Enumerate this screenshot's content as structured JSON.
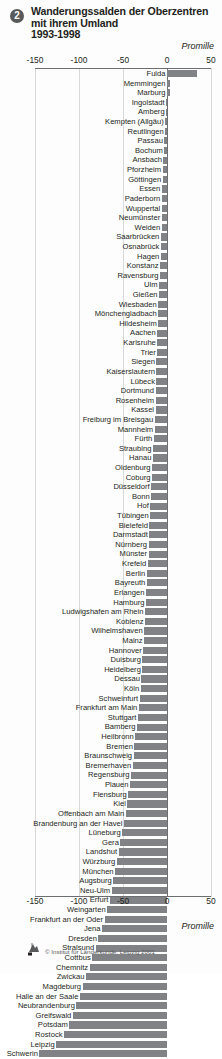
{
  "header": {
    "badge": "2",
    "unit": "Promille"
  },
  "footer": {
    "unit": "Promille",
    "credit": "© Institut für Länderkunde, Leipzig 2001"
  },
  "chart_data": {
    "type": "bar",
    "orientation": "horizontal",
    "xlabel": "Promille",
    "ylabel": "",
    "xlim": [
      -150,
      50
    ],
    "xticks": [
      -150,
      -100,
      -50,
      0,
      50
    ],
    "xticklabels": [
      "-150",
      "-100",
      "-50",
      "0",
      "50"
    ],
    "grid": true,
    "legend": false,
    "categories": [
      "Fulda",
      "Memmingen",
      "Marburg",
      "Ingolstadt",
      "Amberg",
      "Kempten (Allgäu)",
      "Reutlingen",
      "Passau",
      "Bochum",
      "Ansbach",
      "Pforzheim",
      "Göttingen",
      "Essen",
      "Paderborn",
      "Wuppertal",
      "Neumünster",
      "Weiden",
      "Saarbrücken",
      "Osnabrück",
      "Hagen",
      "Konstanz",
      "Ravensburg",
      "Ulm",
      "Gießen",
      "Wiesbaden",
      "Mönchengladbach",
      "Hildesheim",
      "Aachen",
      "Karlsruhe",
      "Trier",
      "Siegen",
      "Kaiserslautern",
      "Lübeck",
      "Dortmund",
      "Rosenheim",
      "Kassel",
      "Freiburg im Breisgau",
      "Mannheim",
      "Fürth",
      "Straubing",
      "Hanau",
      "Oldenburg",
      "Coburg",
      "Düsseldorf",
      "Bonn",
      "Hof",
      "Tübingen",
      "Bielefeld",
      "Darmstadt",
      "Nürnberg",
      "Münster",
      "Krefeld",
      "Berlin",
      "Bayreuth",
      "Erlangen",
      "Hamburg",
      "Ludwigshafen am Rhein",
      "Koblenz",
      "Wilhelmshaven",
      "Mainz",
      "Hannover",
      "Duisburg",
      "Heidelberg",
      "Dessau",
      "Köln",
      "Schweinfurt",
      "Frankfurt am Main",
      "Stuttgart",
      "Bamberg",
      "Heilbronn",
      "Bremen",
      "Braunschweig",
      "Bremerhaven",
      "Regensburg",
      "Plauen",
      "Flensburg",
      "Kiel",
      "Offenbach am Main",
      "Brandenburg an der Havel",
      "Lüneburg",
      "Gera",
      "Landshut",
      "Würzburg",
      "München",
      "Augsburg",
      "Neu-Ulm",
      "Erfurt",
      "Weingarten",
      "Frankfurt an der Oder",
      "Jena",
      "Dresden",
      "Stralsund",
      "Cottbus",
      "Chemnitz",
      "Zwickau",
      "Magdeburg",
      "Halle an der Saale",
      "Neubrandenburg",
      "Greifswald",
      "Potsdam",
      "Rostock",
      "Leipzig",
      "Schwerin"
    ],
    "values": [
      34,
      3,
      3,
      -1,
      -1,
      -2,
      -2,
      -3,
      -3,
      -4,
      -5,
      -5,
      -6,
      -6,
      -6,
      -6,
      -6,
      -7,
      -7,
      -7,
      -8,
      -8,
      -9,
      -9,
      -10,
      -10,
      -10,
      -11,
      -11,
      -11,
      -12,
      -12,
      -12,
      -13,
      -13,
      -13,
      -14,
      -14,
      -15,
      -16,
      -16,
      -17,
      -17,
      -18,
      -18,
      -19,
      -19,
      -20,
      -20,
      -21,
      -21,
      -22,
      -23,
      -23,
      -24,
      -24,
      -25,
      -25,
      -26,
      -26,
      -27,
      -28,
      -28,
      -29,
      -30,
      -31,
      -32,
      -33,
      -34,
      -36,
      -37,
      -38,
      -39,
      -41,
      -42,
      -44,
      -45,
      -47,
      -49,
      -51,
      -53,
      -55,
      -57,
      -59,
      -61,
      -63,
      -65,
      -68,
      -71,
      -74,
      -78,
      -81,
      -85,
      -88,
      -92,
      -96,
      -99,
      -103,
      -107,
      -111,
      -117,
      -126,
      -145
    ],
    "bar_color": "#808285",
    "max_positive": 34,
    "min_negative": -145
  }
}
